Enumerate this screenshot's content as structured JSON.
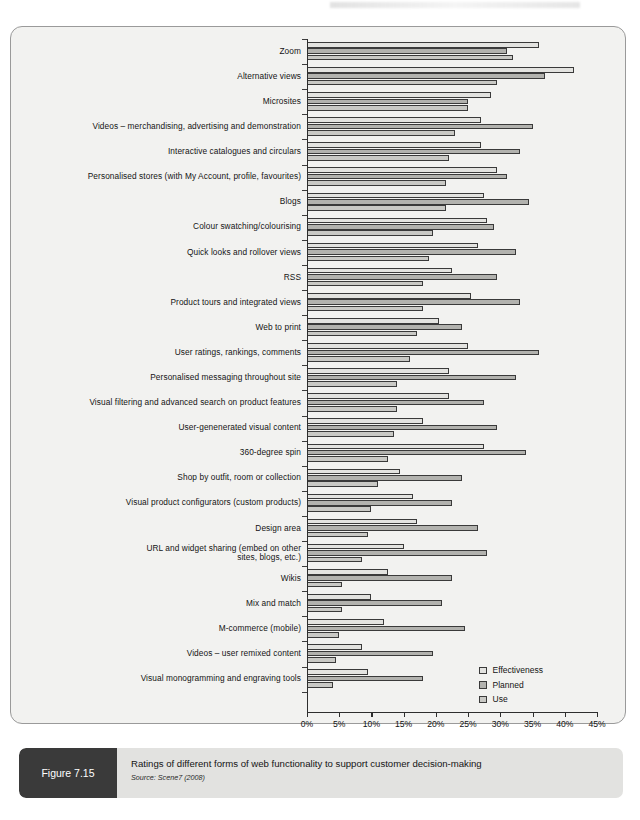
{
  "figure": {
    "tag": "Figure 7.15",
    "title": "Ratings of different forms of web functionality to support customer decision-making",
    "source": "Source: Scene7 (2008)"
  },
  "chart_data": {
    "type": "bar",
    "orientation": "horizontal",
    "title": "Ratings of different forms of web functionality to support customer decision-making",
    "xlabel": "",
    "ylabel": "",
    "xlim": [
      0,
      45
    ],
    "xticks": [
      0,
      5,
      10,
      15,
      20,
      25,
      30,
      35,
      40,
      45
    ],
    "xticklabels": [
      "0%",
      "5%",
      "10%",
      "15%",
      "20%",
      "25%",
      "30%",
      "35%",
      "40%",
      "45%"
    ],
    "grid": false,
    "legend_position": "bottom-right",
    "categories": [
      "Zoom",
      "Alternative views",
      "Microsites",
      "Videos – merchandising, advertising and demonstration",
      "Interactive catalogues and circulars",
      "Personalised stores (with My Account, profile, favourites)",
      "Blogs",
      "Colour swatching/colourising",
      "Quick looks and rollover views",
      "RSS",
      "Product tours and integrated views",
      "Web to print",
      "User ratings, rankings, comments",
      "Personalised messaging throughout site",
      "Visual filtering and advanced search on product features",
      "User-genenerated visual content",
      "360-degree spin",
      "Shop by outfit, room or collection",
      "Visual product configurators (custom products)",
      "Design area",
      "URL and widget sharing (embed on other\nsites, blogs, etc.)",
      "Wikis",
      "Mix and match",
      "M-commerce (mobile)",
      "Videos – user remixed content",
      "Visual monogramming and engraving tools"
    ],
    "series": [
      {
        "name": "Effectiveness",
        "color": "#e3e3e0",
        "values": [
          36.0,
          41.5,
          28.5,
          27.0,
          27.0,
          29.5,
          27.5,
          28.0,
          26.5,
          22.5,
          25.5,
          20.5,
          25.0,
          22.0,
          22.0,
          18.0,
          27.5,
          14.5,
          16.5,
          17.0,
          15.0,
          12.5,
          10.0,
          12.0,
          8.5,
          9.5
        ]
      },
      {
        "name": "Planned",
        "color": "#b2b2ae",
        "values": [
          31.0,
          37.0,
          25.0,
          35.0,
          33.0,
          31.0,
          34.5,
          29.0,
          32.5,
          29.5,
          33.0,
          24.0,
          36.0,
          32.5,
          27.5,
          29.5,
          34.0,
          24.0,
          22.5,
          26.5,
          28.0,
          22.5,
          21.0,
          24.5,
          19.5,
          18.0
        ]
      },
      {
        "name": "Use",
        "color": "#c9c9c5",
        "values": [
          32.0,
          29.5,
          25.0,
          23.0,
          22.0,
          21.5,
          21.5,
          19.5,
          19.0,
          18.0,
          18.0,
          17.0,
          16.0,
          14.0,
          14.0,
          13.5,
          12.5,
          11.0,
          10.0,
          9.5,
          8.5,
          5.5,
          5.5,
          5.0,
          4.5,
          4.0
        ]
      }
    ]
  }
}
